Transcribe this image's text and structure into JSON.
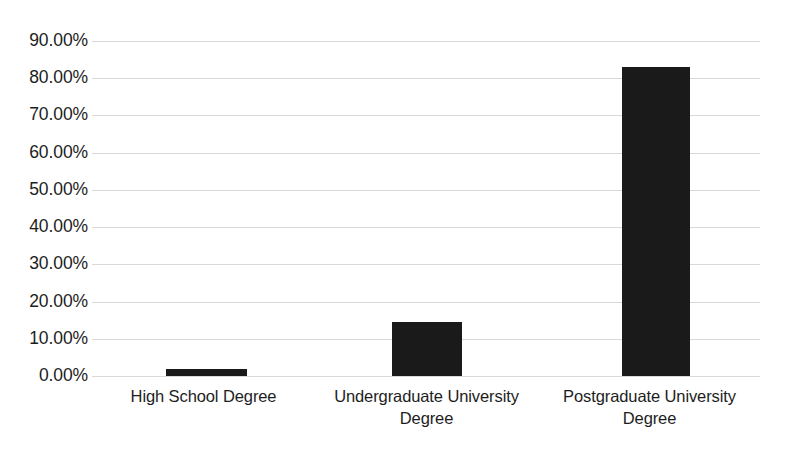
{
  "chart_data": {
    "type": "bar",
    "title": "",
    "subtitle": "",
    "xlabel": "",
    "ylabel": "",
    "categories": [
      "High School Degree",
      "Undergraduate University Degree",
      "Postgraduate University Degree"
    ],
    "values": [
      2.0,
      14.5,
      83.0
    ],
    "value_labels": [
      "2.00%",
      "14.50%",
      "83.00%"
    ],
    "ylim": [
      0,
      90
    ],
    "ytick_values": [
      0,
      10,
      20,
      30,
      40,
      50,
      60,
      70,
      80,
      90
    ],
    "ytick_labels": [
      "0.00%",
      "10.00%",
      "20.00%",
      "30.00%",
      "40.00%",
      "50.00%",
      "60.00%",
      "70.00%",
      "80.00%",
      "90.00%"
    ],
    "grid": true,
    "grid_axis": "y",
    "legend": false,
    "legend_position": "none",
    "series": [
      {
        "name": "",
        "values": [
          2.0,
          14.5,
          83.0
        ]
      }
    ],
    "colors": {
      "bar": "#1a1a1a",
      "gridline": "#d9d9d9",
      "background": "#ffffff",
      "text": "#1d1d1d"
    }
  },
  "axis": {
    "y": {
      "ticks": [
        {
          "label": "90.00%",
          "value": 90
        },
        {
          "label": "80.00%",
          "value": 80
        },
        {
          "label": "70.00%",
          "value": 70
        },
        {
          "label": "60.00%",
          "value": 60
        },
        {
          "label": "50.00%",
          "value": 50
        },
        {
          "label": "40.00%",
          "value": 40
        },
        {
          "label": "30.00%",
          "value": 30
        },
        {
          "label": "20.00%",
          "value": 20
        },
        {
          "label": "10.00%",
          "value": 10
        },
        {
          "label": "0.00%",
          "value": 0
        }
      ]
    },
    "x": {
      "categories": [
        {
          "line1": "High School Degree",
          "line2": ""
        },
        {
          "line1": "Undergraduate University",
          "line2": "Degree"
        },
        {
          "line1": "Postgraduate University",
          "line2": "Degree"
        }
      ]
    }
  }
}
